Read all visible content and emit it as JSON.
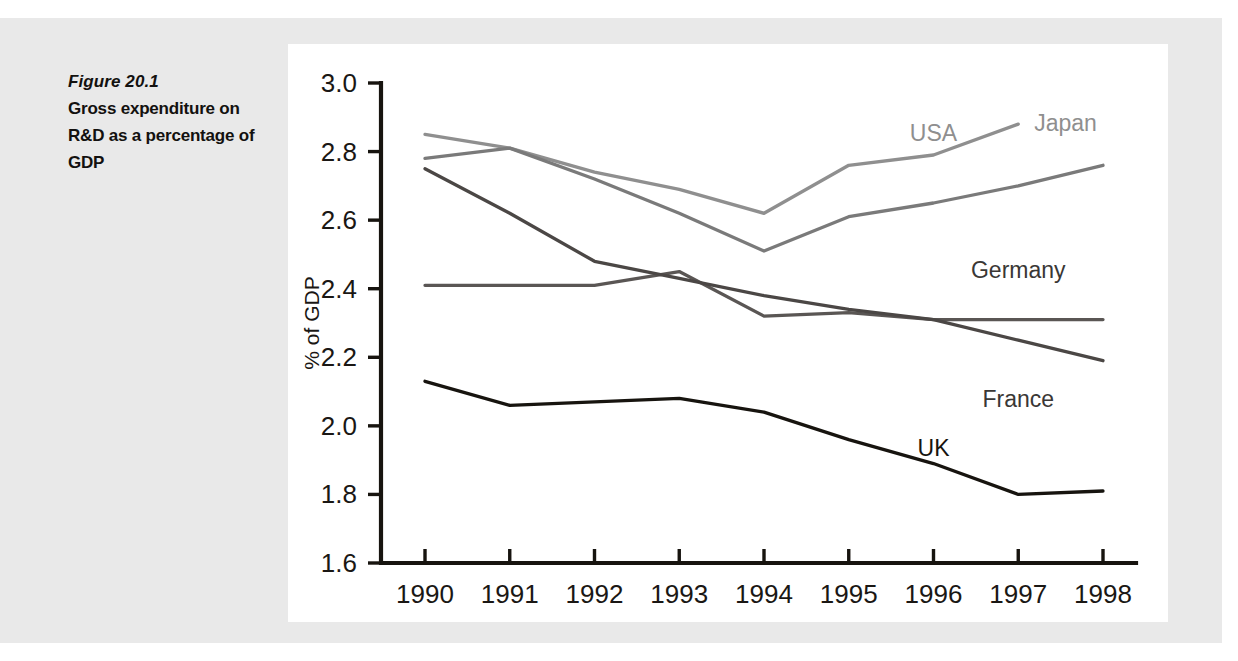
{
  "caption": {
    "figure_number": "Figure 20.1",
    "title": "Gross expenditure on R&D as a percentage of GDP"
  },
  "chart_data": {
    "type": "line",
    "title": "Gross expenditure on R&D as a percentage of GDP",
    "xlabel": "",
    "ylabel": "% of GDP",
    "x": [
      1990,
      1991,
      1992,
      1993,
      1994,
      1995,
      1996,
      1997,
      1998
    ],
    "categories": [
      "1990",
      "1991",
      "1992",
      "1993",
      "1994",
      "1995",
      "1996",
      "1997",
      "1998"
    ],
    "xlim": [
      1990,
      1998
    ],
    "ylim": [
      1.6,
      3.0
    ],
    "yticks": [
      "3.0",
      "2.8",
      "2.6",
      "2.4",
      "2.2",
      "2.0",
      "1.8",
      "1.6"
    ],
    "ytick_values": [
      3.0,
      2.8,
      2.6,
      2.4,
      2.2,
      2.0,
      1.8,
      1.6
    ],
    "grid": false,
    "legend": "inline-right-of-series",
    "series": [
      {
        "name": "Japan",
        "color": "#8f8f8f",
        "label_color": "#8f8f8f",
        "label_anchor_year": 1997,
        "label_anchor_value": 2.88,
        "label_position": "above-right",
        "x": [
          1990,
          1991,
          1992,
          1993,
          1994,
          1995,
          1996,
          1997
        ],
        "values": [
          2.85,
          2.81,
          2.74,
          2.69,
          2.62,
          2.76,
          2.79,
          2.88
        ]
      },
      {
        "name": "USA",
        "color": "#7a7a7a",
        "label_color": "#8f8f8f",
        "label_anchor_year": 1996,
        "label_anchor_value": 2.8,
        "label_position": "above",
        "x": [
          1990,
          1991,
          1992,
          1993,
          1994,
          1995,
          1996,
          1997,
          1998
        ],
        "values": [
          2.78,
          2.81,
          2.72,
          2.62,
          2.51,
          2.61,
          2.65,
          2.7,
          2.76
        ]
      },
      {
        "name": "Germany",
        "color": "#5a5654",
        "label_color": "#3a3735",
        "label_anchor_year": 1997,
        "label_anchor_value": 2.4,
        "label_position": "above",
        "x": [
          1990,
          1991,
          1992,
          1993,
          1994,
          1995,
          1996,
          1997,
          1998
        ],
        "values": [
          2.41,
          2.41,
          2.41,
          2.45,
          2.32,
          2.33,
          2.31,
          2.31,
          2.31
        ]
      },
      {
        "name": "France",
        "color": "#4b4745",
        "label_color": "#3a3735",
        "label_anchor_year": 1997,
        "label_anchor_value": 2.13,
        "label_position": "below",
        "x": [
          1990,
          1991,
          1992,
          1993,
          1994,
          1995,
          1996,
          1997,
          1998
        ],
        "values": [
          2.75,
          2.62,
          2.48,
          2.43,
          2.38,
          2.34,
          2.31,
          2.25,
          2.19
        ]
      },
      {
        "name": "UK",
        "color": "#17140f",
        "label_color": "#17140f",
        "label_anchor_year": 1996,
        "label_anchor_value": 1.88,
        "label_position": "above",
        "x": [
          1990,
          1991,
          1992,
          1993,
          1994,
          1995,
          1996,
          1997,
          1998
        ],
        "values": [
          2.13,
          2.06,
          2.07,
          2.08,
          2.04,
          1.96,
          1.89,
          1.8,
          1.81
        ]
      }
    ]
  },
  "colors": {
    "page_background": "#e9e9e9",
    "panel_background": "#ffffff",
    "axis": "#17140f",
    "text": "#1a1714"
  }
}
